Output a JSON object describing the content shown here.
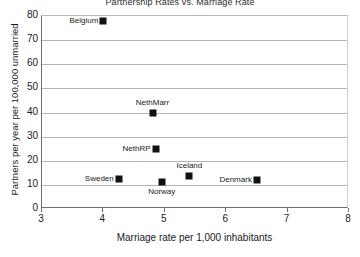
{
  "chart_data": {
    "type": "scatter",
    "title": "Partnership Rates vs. Marriage Rate",
    "xlabel": "Marriage rate per 1,000 inhabitants",
    "ylabel": "Partners per year per 100,000 unmarried",
    "xlim": [
      3,
      8
    ],
    "ylim": [
      0,
      80
    ],
    "xticks": [
      3,
      4,
      5,
      6,
      7,
      8
    ],
    "yticks": [
      0,
      10,
      20,
      30,
      40,
      50,
      60,
      70,
      80
    ],
    "grid": "horizontal",
    "legend": "none",
    "marker": "filled-square",
    "marker_color": "#111111",
    "points": [
      {
        "label": "Belgium",
        "x": 4.0,
        "y": 78.0,
        "label_position": "left"
      },
      {
        "label": "NethMarr",
        "x": 4.8,
        "y": 40.0,
        "label_position": "above"
      },
      {
        "label": "NethRP",
        "x": 4.85,
        "y": 25.0,
        "label_position": "left"
      },
      {
        "label": "Sweden",
        "x": 4.25,
        "y": 12.5,
        "label_position": "left"
      },
      {
        "label": "Norway",
        "x": 4.95,
        "y": 11.0,
        "label_position": "below"
      },
      {
        "label": "Iceland",
        "x": 5.4,
        "y": 13.5,
        "label_position": "above"
      },
      {
        "label": "Denmark",
        "x": 6.5,
        "y": 12.0,
        "label_position": "left"
      }
    ]
  }
}
